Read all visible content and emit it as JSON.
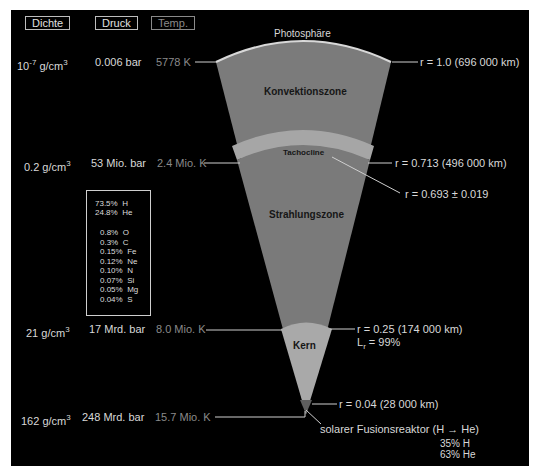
{
  "headers": {
    "density": "Dichte",
    "pressure": "Druck",
    "temperature": "Temp."
  },
  "surface": {
    "label": "Photosphäre",
    "density_base": "10",
    "density_exp": "-7",
    "density_unit": " g/cm",
    "density_unit_exp": "3",
    "pressure": "0.006 bar",
    "temperature": "5778 K",
    "radius": "r = 1.0  (696 000 km)"
  },
  "tachocline": {
    "label": "Tachocline",
    "density": "0.2 g/cm",
    "density_exp": "3",
    "pressure": "53 Mio. bar",
    "temperature": "2.4 Mio. K",
    "radius_outer": "r = 0.713  (496 000 km)",
    "radius_inner": "r = 0.693 ± 0.019"
  },
  "zones": {
    "convection": "Konvektionszone",
    "radiation": "Strahlungszone",
    "core": "Kern"
  },
  "composition": {
    "items": [
      {
        "pct": "73.5%",
        "el": "H"
      },
      {
        "pct": "24.8%",
        "el": "He"
      },
      {
        "pct": "0.8%",
        "el": "O"
      },
      {
        "pct": "0.3%",
        "el": "C"
      },
      {
        "pct": "0.15%",
        "el": "Fe"
      },
      {
        "pct": "0.12%",
        "el": "Ne"
      },
      {
        "pct": "0.10%",
        "el": "N"
      },
      {
        "pct": "0.07%",
        "el": "Si"
      },
      {
        "pct": "0.05%",
        "el": "Mg"
      },
      {
        "pct": "0.04%",
        "el": "S"
      }
    ]
  },
  "core_boundary": {
    "density": "21 g/cm",
    "density_exp": "3",
    "pressure": "17 Mrd. bar",
    "temperature": "8.0 Mio. K",
    "radius": "r = 0.25  (174 000 km)",
    "luminosity_L": "L",
    "luminosity_sub": "r",
    "luminosity_val": " = 99%"
  },
  "center": {
    "density": "162 g/cm",
    "density_exp": "3",
    "pressure": "248 Mrd. bar",
    "temperature": "15.7 Mio. K",
    "radius": "r = 0.04   (28 000 km)",
    "reactor": "solarer Fusionsreaktor  (H → He)",
    "reactor_h": "35%  H",
    "reactor_he": "63%  He"
  },
  "colors": {
    "background": "#000000",
    "convection_zone": "#7b7b7b",
    "radiation_zone": "#7a7a7a",
    "tachocline_band": "#a6a6a6",
    "core": "#a9a9a9",
    "photosphere_rim": "#d0d0d0",
    "fusion_core": "#5e5e5e"
  }
}
